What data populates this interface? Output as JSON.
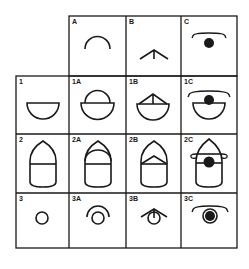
{
  "diagram": {
    "columns": [
      "A",
      "B",
      "C"
    ],
    "rows": [
      "1",
      "2",
      "3"
    ],
    "header_cells": [
      {
        "label": "A",
        "shape": "arc"
      },
      {
        "label": "B",
        "shape": "chevron-with-stem"
      },
      {
        "label": "C",
        "shape": "brim-with-dot"
      }
    ],
    "row_cells": [
      [
        {
          "label": "1",
          "shape": "half-bowl"
        },
        {
          "label": "1A",
          "shape": "half-bowl + arc"
        },
        {
          "label": "1B",
          "shape": "half-bowl + chevron"
        },
        {
          "label": "1C",
          "shape": "half-bowl + brim-with-dot"
        }
      ],
      [
        {
          "label": "2",
          "shape": "bullet"
        },
        {
          "label": "2A",
          "shape": "bullet + arc"
        },
        {
          "label": "2B",
          "shape": "bullet + chevron"
        },
        {
          "label": "2C",
          "shape": "bullet + brim-with-dot"
        }
      ],
      [
        {
          "label": "3",
          "shape": "small-circle"
        },
        {
          "label": "3A",
          "shape": "small-circle + arc"
        },
        {
          "label": "3B",
          "shape": "small-circle + chevron"
        },
        {
          "label": "3C",
          "shape": "small-circle + brim-with-dot"
        }
      ]
    ],
    "colors": {
      "line": "#1a1a1a",
      "background": "#ffffff"
    }
  }
}
